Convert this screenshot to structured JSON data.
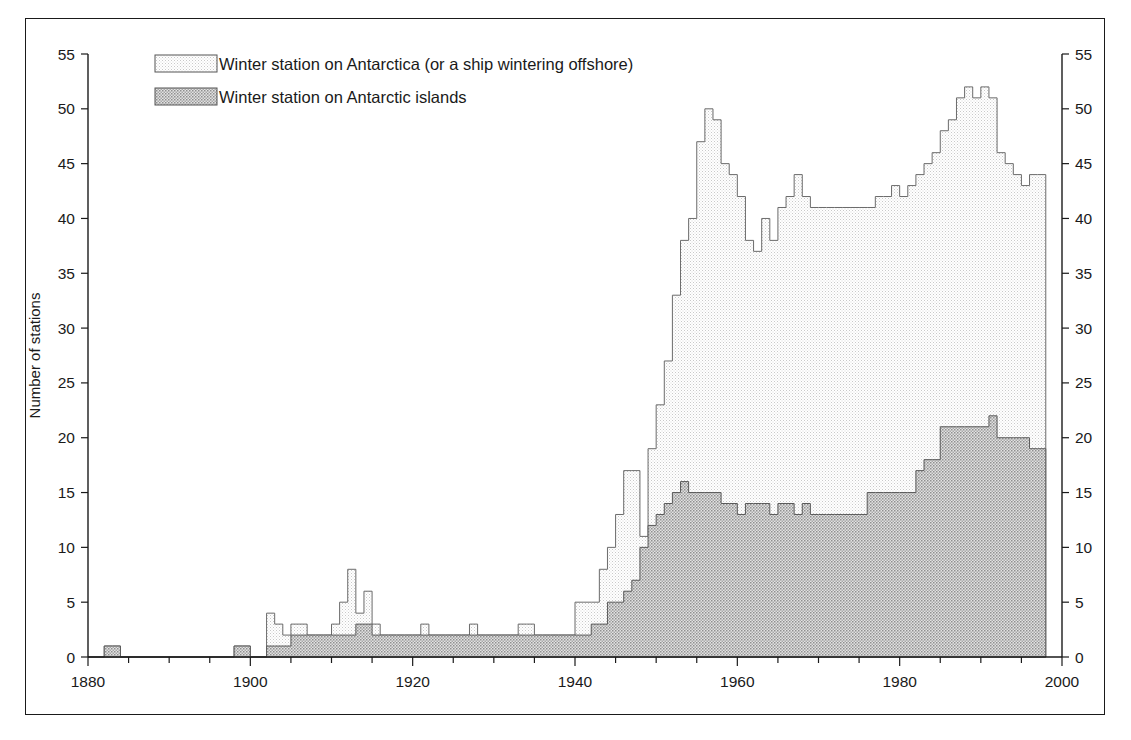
{
  "figure": {
    "border_color": "#1a1a1a",
    "background": "#ffffff"
  },
  "axes": {
    "y_title": "Number of stations",
    "y_ticks": [
      0,
      5,
      10,
      15,
      20,
      25,
      30,
      35,
      40,
      45,
      50,
      55
    ],
    "y_min": 0,
    "y_max": 55,
    "x_ticks_major": [
      1880,
      1900,
      1920,
      1940,
      1960,
      1980,
      2000
    ],
    "x_minor_step": 5,
    "x_min": 1880,
    "x_max": 2000,
    "right_axis_mirrors_left": true
  },
  "legend": {
    "items": [
      {
        "label": "Winter station on Antarctica (or a ship wintering offshore)",
        "swatch": "light",
        "color": "#ededed"
      },
      {
        "label": "Winter station on Antarctic islands",
        "swatch": "dark",
        "color": "#b4b4b4"
      }
    ]
  },
  "chart_data": {
    "type": "area",
    "title": "",
    "subtitle": "",
    "xlabel": "",
    "ylabel": "Number of stations",
    "xlim": [
      1880,
      2000
    ],
    "ylim": [
      0,
      55
    ],
    "grid": false,
    "legend_position": "top-left",
    "stacked": true,
    "step_style": "post",
    "x": [
      1880,
      1881,
      1882,
      1883,
      1884,
      1885,
      1886,
      1887,
      1888,
      1889,
      1890,
      1891,
      1892,
      1893,
      1894,
      1895,
      1896,
      1897,
      1898,
      1899,
      1900,
      1901,
      1902,
      1903,
      1904,
      1905,
      1906,
      1907,
      1908,
      1909,
      1910,
      1911,
      1912,
      1913,
      1914,
      1915,
      1916,
      1917,
      1918,
      1919,
      1920,
      1921,
      1922,
      1923,
      1924,
      1925,
      1926,
      1927,
      1928,
      1929,
      1930,
      1931,
      1932,
      1933,
      1934,
      1935,
      1936,
      1937,
      1938,
      1939,
      1940,
      1941,
      1942,
      1943,
      1944,
      1945,
      1946,
      1947,
      1948,
      1949,
      1950,
      1951,
      1952,
      1953,
      1954,
      1955,
      1956,
      1957,
      1958,
      1959,
      1960,
      1961,
      1962,
      1963,
      1964,
      1965,
      1966,
      1967,
      1968,
      1969,
      1970,
      1971,
      1972,
      1973,
      1974,
      1975,
      1976,
      1977,
      1978,
      1979,
      1980,
      1981,
      1982,
      1983,
      1984,
      1985,
      1986,
      1987,
      1988,
      1989,
      1990,
      1991,
      1992,
      1993,
      1994,
      1995,
      1996,
      1997
    ],
    "series": [
      {
        "name": "Winter station on Antarctic islands",
        "color": "#b4b4b4",
        "values": [
          0,
          0,
          1,
          1,
          0,
          0,
          0,
          0,
          0,
          0,
          0,
          0,
          0,
          0,
          0,
          0,
          0,
          0,
          1,
          1,
          0,
          0,
          1,
          1,
          1,
          2,
          2,
          2,
          2,
          2,
          2,
          2,
          2,
          3,
          3,
          2,
          2,
          2,
          2,
          2,
          2,
          2,
          2,
          2,
          2,
          2,
          2,
          2,
          2,
          2,
          2,
          2,
          2,
          2,
          2,
          2,
          2,
          2,
          2,
          2,
          2,
          2,
          3,
          3,
          5,
          5,
          6,
          7,
          10,
          12,
          13,
          14,
          15,
          16,
          15,
          15,
          15,
          15,
          14,
          14,
          13,
          14,
          14,
          14,
          13,
          14,
          14,
          13,
          14,
          13,
          13,
          13,
          13,
          13,
          13,
          13,
          15,
          15,
          15,
          15,
          15,
          15,
          17,
          18,
          18,
          21,
          21,
          21,
          21,
          21,
          21,
          22,
          20,
          20,
          20,
          20,
          19,
          19
        ]
      },
      {
        "name": "Winter station on Antarctica (or a ship wintering offshore)",
        "color": "#ededed",
        "values": [
          0,
          0,
          0,
          0,
          0,
          0,
          0,
          0,
          0,
          0,
          0,
          0,
          0,
          0,
          0,
          0,
          0,
          0,
          0,
          0,
          0,
          0,
          3,
          2,
          1,
          1,
          1,
          0,
          0,
          0,
          1,
          3,
          6,
          1,
          3,
          1,
          0,
          0,
          0,
          0,
          0,
          1,
          0,
          0,
          0,
          0,
          0,
          1,
          0,
          0,
          0,
          0,
          0,
          1,
          1,
          0,
          0,
          0,
          0,
          0,
          3,
          3,
          2,
          5,
          5,
          8,
          11,
          10,
          1,
          7,
          10,
          13,
          18,
          22,
          25,
          32,
          35,
          34,
          31,
          30,
          29,
          24,
          23,
          26,
          25,
          27,
          28,
          31,
          28,
          28,
          28,
          28,
          28,
          28,
          28,
          28,
          26,
          27,
          27,
          28,
          27,
          28,
          27,
          27,
          28,
          27,
          28,
          30,
          31,
          30,
          31,
          29,
          26,
          25,
          24,
          23,
          25,
          25
        ]
      }
    ],
    "totals_peaks": [
      {
        "year": 1957,
        "value": 50.5,
        "label": "first major peak"
      },
      {
        "year": 1990,
        "value": 52.5,
        "label": "overall maximum"
      }
    ]
  }
}
